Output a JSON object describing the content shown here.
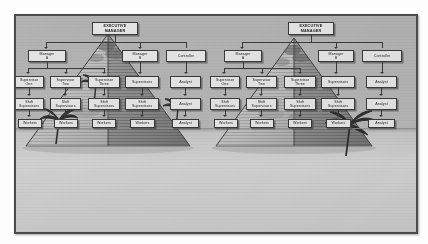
{
  "document": {
    "title": "Organizational Chart Over Pyramids Illustration",
    "caption": ""
  },
  "scene": {
    "name": "desert-scene",
    "description": "Two great pyramids on desert sand with palm trees and a horizon line",
    "horizon_label": "",
    "colors": {
      "sky": "#b5b5b5",
      "sand": "#cccccc",
      "pyramid_light": "#c3c3c3",
      "pyramid_dark": "#8f8f8f",
      "ink": "#3a3a3a",
      "frame": "#4c4c4c",
      "node_fill": "#e4e4e4"
    },
    "pyramids": [
      {
        "id": "pyramid-left",
        "label": ""
      },
      {
        "id": "pyramid-right",
        "label": ""
      }
    ],
    "palm_trees": [
      {
        "id": "palm-far-left",
        "label": ""
      },
      {
        "id": "palm-left-mid",
        "label": ""
      },
      {
        "id": "palm-center",
        "label": ""
      },
      {
        "id": "palm-right",
        "label": ""
      }
    ]
  },
  "org_chart": {
    "title": "",
    "levels": [
      "executive",
      "managers",
      "supervisors",
      "shift-supervisors",
      "workers"
    ],
    "nodes": {
      "executive_manager": "EXECUTIVE\nMANAGER",
      "manager_a": "Manager\nA",
      "manager_b": "Manager\nB",
      "controller": "Controller",
      "supervisor_one": "Supervisor\nOne",
      "supervisor_two": "Supervisor\nTwo",
      "supervisor_three": "Supervisor\nThree",
      "supervisors": "Supervisors",
      "analyst_1": "Analyst",
      "shift_supervisors_1": "Shift\nSupervisors",
      "shift_supervisors_2": "Shift\nSupervisors",
      "shift_supervisors_3": "Shift\nSupervisors",
      "shift_supervisors_4": "Shift\nSupervisors",
      "analyst_2": "Analyst",
      "workers_1": "Workers",
      "workers_2": "Workers",
      "workers_3": "Workers",
      "workers_4": "Workers",
      "analyst_3": "Analyst"
    }
  },
  "copies": [
    {
      "id": "chart-left",
      "position": "left"
    },
    {
      "id": "chart-right",
      "position": "right"
    }
  ]
}
